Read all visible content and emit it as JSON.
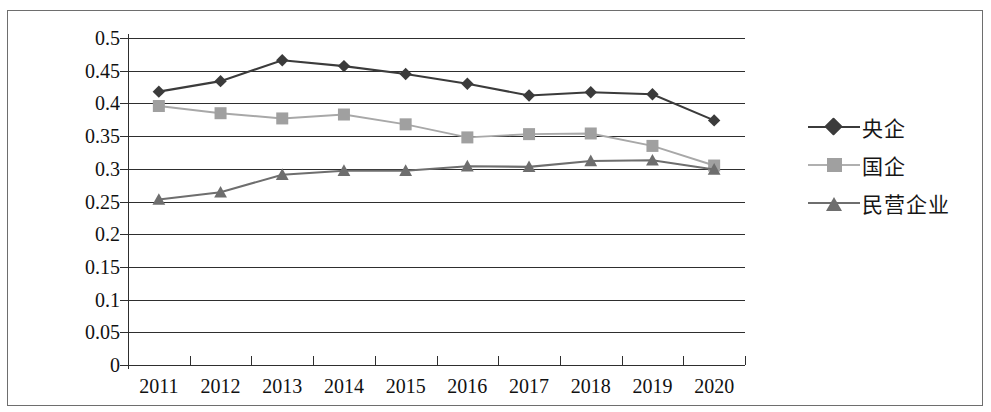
{
  "chart_data": {
    "type": "line",
    "title": "",
    "xlabel": "",
    "ylabel": "",
    "categories": [
      "2011",
      "2012",
      "2013",
      "2014",
      "2015",
      "2016",
      "2017",
      "2018",
      "2019",
      "2020"
    ],
    "ylim": [
      0,
      0.5
    ],
    "yticks": [
      "0",
      "0.05",
      "0.1",
      "0.15",
      "0.2",
      "0.25",
      "0.3",
      "0.35",
      "0.4",
      "0.45",
      "0.5"
    ],
    "ytick_values": [
      0,
      0.05,
      0.1,
      0.15,
      0.2,
      0.25,
      0.3,
      0.35,
      0.4,
      0.45,
      0.5
    ],
    "grid": true,
    "legend_position": "right",
    "series": [
      {
        "name": "央企",
        "marker": "diamond",
        "color": "#3b3b3b",
        "line_color": "#3b3b3b",
        "values": [
          0.418,
          0.434,
          0.466,
          0.457,
          0.445,
          0.43,
          0.412,
          0.417,
          0.414,
          0.374
        ]
      },
      {
        "name": "国企",
        "marker": "square",
        "color": "#a0a0a0",
        "line_color": "#a8a8a8",
        "values": [
          0.396,
          0.385,
          0.377,
          0.383,
          0.368,
          0.348,
          0.353,
          0.354,
          0.335,
          0.305
        ]
      },
      {
        "name": "民营企业",
        "marker": "triangle",
        "color": "#6e6e6e",
        "line_color": "#6e6e6e",
        "values": [
          0.253,
          0.264,
          0.291,
          0.297,
          0.297,
          0.304,
          0.303,
          0.312,
          0.313,
          0.299
        ]
      }
    ]
  },
  "legend": {
    "items": [
      {
        "label": "央企"
      },
      {
        "label": "国企"
      },
      {
        "label": "民营企业"
      }
    ]
  },
  "axes": {
    "y_tick_labels": [
      "0.5",
      "0.45",
      "0.4",
      "0.35",
      "0.3",
      "0.25",
      "0.2",
      "0.15",
      "0.1",
      "0.05",
      "0"
    ],
    "x_tick_labels": [
      "2011",
      "2012",
      "2013",
      "2014",
      "2015",
      "2016",
      "2017",
      "2018",
      "2019",
      "2020"
    ]
  },
  "colors": {
    "axis": "#2e2e2e",
    "grid": "#2e2e2e",
    "frame": "#6e6e6e",
    "series_1": "#3b3b3b",
    "series_2": "#a0a0a0",
    "series_3": "#6e6e6e",
    "background": "#ffffff"
  }
}
